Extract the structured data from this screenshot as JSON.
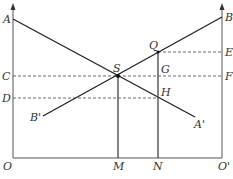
{
  "diagram": {
    "type": "economics-two-axis-line-diagram",
    "labels": {
      "A": "A",
      "B": "B",
      "C": "C",
      "D": "D",
      "E": "E",
      "F": "F",
      "G": "G",
      "H": "H",
      "Q": "Q",
      "S": "S",
      "A_prime": "A'",
      "B_prime": "B'",
      "O": "O",
      "O_prime": "O'",
      "M": "M",
      "N": "N"
    },
    "lines": [
      {
        "name": "AA'",
        "from": "A",
        "to": "A'",
        "style": "solid"
      },
      {
        "name": "B'B",
        "from": "B'",
        "to": "B",
        "style": "solid"
      },
      {
        "name": "SM",
        "from": "S",
        "to": "M",
        "style": "solid-vertical"
      },
      {
        "name": "QN",
        "from": "Q",
        "to": "N",
        "style": "solid-vertical"
      },
      {
        "name": "CF",
        "from": "C",
        "to": "F",
        "style": "dashed"
      },
      {
        "name": "DH",
        "from": "D",
        "to": "H",
        "style": "dashed"
      },
      {
        "name": "QE",
        "from": "Q",
        "to": "E",
        "style": "dashed"
      }
    ],
    "points": [
      "S",
      "Q"
    ],
    "axes": {
      "left": "OA (vertical, arrow up)",
      "right": "O'B (vertical, arrow up)",
      "base": "OO'"
    },
    "colors": {
      "line": "#222222",
      "axis": "#555555",
      "dashed": "#444444",
      "label": "#333333"
    }
  }
}
